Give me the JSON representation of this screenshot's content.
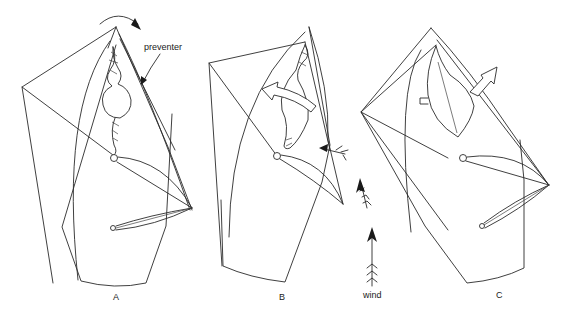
{
  "diagram": {
    "panels": [
      {
        "id": "A",
        "caption": "A"
      },
      {
        "id": "B",
        "caption": "B"
      },
      {
        "id": "C",
        "caption": "C"
      }
    ],
    "annotations": {
      "preventer_label": "preventer",
      "wind_label": "wind"
    },
    "colors": {
      "line": "#2a2a2a",
      "background": "#ffffff"
    }
  }
}
